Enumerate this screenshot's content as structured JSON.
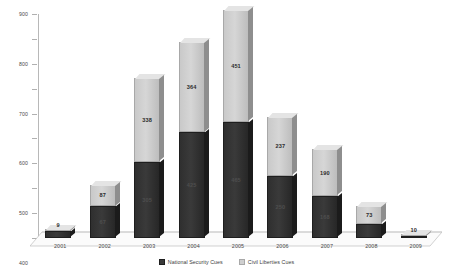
{
  "chart_data": {
    "type": "bar",
    "subtype": "stacked-column-3d",
    "title": "",
    "xlabel": "",
    "ylabel": "",
    "ylim": [
      0,
      900
    ],
    "ytick_step": 100,
    "yticks": [
      0,
      100,
      200,
      300,
      400,
      500,
      600,
      700,
      800,
      900
    ],
    "grid": false,
    "legend_position": "bottom",
    "categories": [
      "2001",
      "2002",
      "2003",
      "2004",
      "2005",
      "2006",
      "2007",
      "2008",
      "2009"
    ],
    "series": [
      {
        "name": "National Security Cues",
        "color": "#3a3a3a",
        "values": [
          28,
          128,
          305,
          425,
          465,
          250,
          168,
          55,
          8
        ],
        "labels": [
          "",
          "67",
          "305",
          "425",
          "465",
          "250",
          "168",
          "",
          ""
        ]
      },
      {
        "name": "Civil Liberties Cues",
        "color": "#cfcfcf",
        "values": [
          9,
          87,
          338,
          364,
          451,
          237,
          190,
          73,
          10
        ],
        "labels": [
          "9",
          "87",
          "338",
          "364",
          "451",
          "237",
          "190",
          "73",
          "10"
        ]
      }
    ],
    "totals": [
      37,
      215,
      643,
      789,
      916,
      487,
      358,
      128,
      18
    ]
  },
  "legend": {
    "items": [
      {
        "label": "National Security Cues",
        "swatch": "dark"
      },
      {
        "label": "Civil Liberties Cues",
        "swatch": "light"
      }
    ]
  }
}
